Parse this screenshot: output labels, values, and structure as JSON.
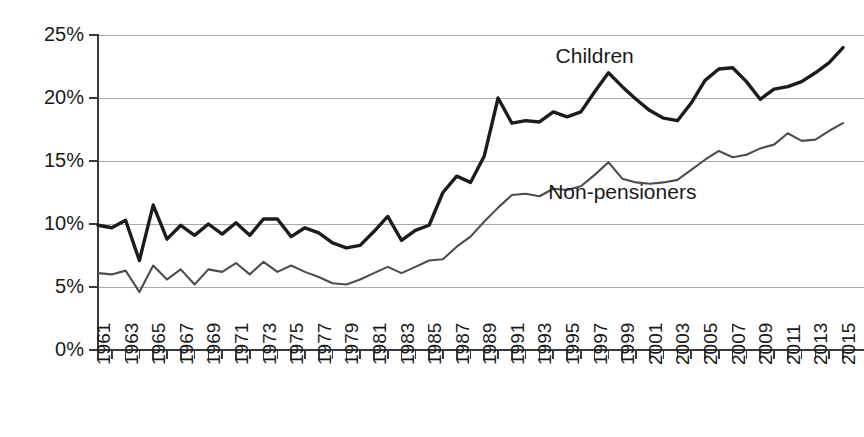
{
  "chart_data": {
    "type": "line",
    "title": "",
    "subtitle": "",
    "xlabel": "",
    "ylabel": "",
    "xlim": [
      1961,
      2015
    ],
    "ylim": [
      0,
      25
    ],
    "grid": true,
    "grid_axis": "y",
    "legend_position": "inline-annotations",
    "y_tick_labels": [
      "0%",
      "5%",
      "10%",
      "15%",
      "20%",
      "25%"
    ],
    "y_tick_values": [
      0,
      5,
      10,
      15,
      20,
      25
    ],
    "x_tick_labels": [
      "1961",
      "1963",
      "1965",
      "1967",
      "1969",
      "1971",
      "1973",
      "1975",
      "1977",
      "1979",
      "1981",
      "1983",
      "1985",
      "1987",
      "1989",
      "1991",
      "1993",
      "1995",
      "1997",
      "1999",
      "2001",
      "2003",
      "2005",
      "2007",
      "2009",
      "2011",
      "2013",
      "2015"
    ],
    "x_tick_values": [
      1961,
      1963,
      1965,
      1967,
      1969,
      1971,
      1973,
      1975,
      1977,
      1979,
      1981,
      1983,
      1985,
      1987,
      1989,
      1991,
      1993,
      1995,
      1997,
      1999,
      2001,
      2003,
      2005,
      2007,
      2009,
      2011,
      2013,
      2015
    ],
    "x": [
      1961,
      1962,
      1963,
      1964,
      1965,
      1966,
      1967,
      1968,
      1969,
      1970,
      1971,
      1972,
      1973,
      1974,
      1975,
      1976,
      1977,
      1978,
      1979,
      1980,
      1981,
      1982,
      1983,
      1984,
      1985,
      1986,
      1987,
      1988,
      1989,
      1990,
      1991,
      1992,
      1993,
      1994,
      1995,
      1996,
      1997,
      1998,
      1999,
      2000,
      2001,
      2002,
      2003,
      2004,
      2005,
      2006,
      2007,
      2008,
      2009,
      2010,
      2011,
      2012,
      2013,
      2014,
      2015
    ],
    "series": [
      {
        "name": "Children",
        "color": "#1c1c1c",
        "line_width": "thick",
        "annotation": "Children",
        "annotation_x": 1997,
        "annotation_y": 23.2,
        "values": [
          9.9,
          9.7,
          10.3,
          7.1,
          11.5,
          8.8,
          9.9,
          9.1,
          10.0,
          9.2,
          10.1,
          9.1,
          10.4,
          10.4,
          9.0,
          9.7,
          9.3,
          8.5,
          8.1,
          8.3,
          9.4,
          10.6,
          8.7,
          9.5,
          9.9,
          12.5,
          13.8,
          13.3,
          15.4,
          20.0,
          18.0,
          18.2,
          18.1,
          18.9,
          18.5,
          18.9,
          20.5,
          22.0,
          20.9,
          19.9,
          19.0,
          18.4,
          18.2,
          19.6,
          21.4,
          22.3,
          22.4,
          21.3,
          19.9,
          20.7,
          20.9,
          21.3,
          22.0,
          22.8,
          24.0
        ]
      },
      {
        "name": "Non-pensioners",
        "color": "#4d4d4d",
        "line_width": "thin",
        "annotation": "Non-pensioners",
        "annotation_x": 1999,
        "annotation_y": 12.4,
        "values": [
          6.1,
          6.0,
          6.3,
          4.6,
          6.7,
          5.6,
          6.4,
          5.2,
          6.4,
          6.2,
          6.9,
          6.0,
          7.0,
          6.2,
          6.7,
          6.2,
          5.8,
          5.3,
          5.2,
          5.6,
          6.1,
          6.6,
          6.1,
          6.6,
          7.1,
          7.2,
          8.2,
          9.0,
          10.2,
          11.3,
          12.3,
          12.4,
          12.2,
          12.8,
          12.7,
          13.0,
          13.9,
          14.9,
          13.6,
          13.3,
          13.2,
          13.3,
          13.5,
          14.3,
          15.1,
          15.8,
          15.3,
          15.5,
          16.0,
          16.3,
          17.2,
          16.6,
          16.7,
          17.4,
          18.0
        ]
      }
    ]
  },
  "annotations": {
    "children_label": "Children",
    "non_pensioners_label": "Non-pensioners"
  }
}
